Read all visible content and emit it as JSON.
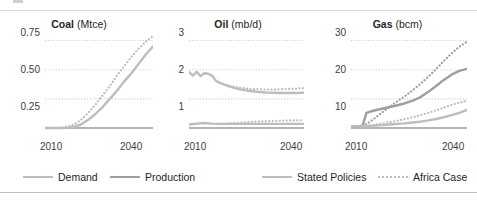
{
  "legend": {
    "items": [
      {
        "label": "Demand",
        "style": "solid",
        "color": "#bdbdbd"
      },
      {
        "label": "Production",
        "style": "solid",
        "color": "#9e9e9e"
      },
      {
        "label": "Stated Policies",
        "style": "solid",
        "color": "#bdbdbd"
      },
      {
        "label": "Africa Case",
        "style": "dotted",
        "color": "#bdbdbd"
      }
    ]
  },
  "colors": {
    "demand": "#bdbdbd",
    "production": "#9e9e9e",
    "gridline": "#c9c9c9",
    "axis": "#9b9b9b",
    "text": "#262626"
  },
  "chart_data": [
    {
      "type": "line",
      "title": "Coal (Mtce)",
      "title_bold": "Coal",
      "title_unit": "(Mtce)",
      "xlabel": "",
      "ylabel": "Mtce",
      "xlim": [
        2010,
        2040
      ],
      "ylim": [
        0,
        0.875
      ],
      "yticks": [
        0.25,
        0.5,
        0.75
      ],
      "ytick_labels": [
        "0.25",
        "0.50",
        "0.75"
      ],
      "xticks": [
        2010,
        2040
      ],
      "xtick_labels": [
        "2010",
        "2040"
      ],
      "grid": true,
      "legend_position": "below-figure",
      "series": [
        {
          "name": "Stated Policies",
          "style": "solid",
          "color": "#bdbdbd",
          "x": [
            2010,
            2012,
            2014,
            2016,
            2018,
            2020,
            2022,
            2024,
            2026,
            2028,
            2030,
            2032,
            2034,
            2036,
            2038,
            2040
          ],
          "values": [
            0.0,
            0.0,
            0.0,
            0.0,
            0.01,
            0.03,
            0.07,
            0.12,
            0.18,
            0.25,
            0.32,
            0.4,
            0.47,
            0.55,
            0.63,
            0.7
          ]
        },
        {
          "name": "Africa Case",
          "style": "dotted",
          "color": "#bdbdbd",
          "x": [
            2010,
            2012,
            2014,
            2016,
            2018,
            2020,
            2022,
            2024,
            2026,
            2028,
            2030,
            2032,
            2034,
            2036,
            2038,
            2040
          ],
          "values": [
            0.0,
            0.0,
            0.0,
            0.01,
            0.03,
            0.07,
            0.13,
            0.2,
            0.28,
            0.36,
            0.45,
            0.53,
            0.61,
            0.68,
            0.74,
            0.79
          ]
        }
      ]
    },
    {
      "type": "line",
      "title": "Oil (mb/d)",
      "title_bold": "Oil",
      "title_unit": "(mb/d)",
      "xlabel": "",
      "ylabel": "mb/d",
      "xlim": [
        2010,
        2040
      ],
      "ylim": [
        0,
        3.5
      ],
      "yticks": [
        1,
        2,
        3
      ],
      "ytick_labels": [
        "1",
        "2",
        "3"
      ],
      "xticks": [
        2010,
        2040
      ],
      "xtick_labels": [
        "2010",
        "2040"
      ],
      "grid": true,
      "legend_position": "below-figure",
      "series": [
        {
          "name": "Demand Stated Policies",
          "style": "solid",
          "color": "#bdbdbd",
          "x": [
            2010,
            2011,
            2012,
            2013,
            2014,
            2015,
            2016,
            2017,
            2018,
            2020,
            2022,
            2024,
            2026,
            2028,
            2030,
            2032,
            2034,
            2036,
            2038,
            2040
          ],
          "values": [
            1.93,
            1.8,
            1.93,
            1.78,
            1.88,
            1.86,
            1.8,
            1.62,
            1.55,
            1.45,
            1.37,
            1.31,
            1.27,
            1.24,
            1.22,
            1.21,
            1.2,
            1.2,
            1.2,
            1.21
          ]
        },
        {
          "name": "Demand Africa Case",
          "style": "dotted",
          "color": "#bdbdbd",
          "x": [
            2018,
            2020,
            2022,
            2024,
            2026,
            2028,
            2030,
            2032,
            2034,
            2036,
            2038,
            2040
          ],
          "values": [
            1.55,
            1.47,
            1.41,
            1.37,
            1.34,
            1.33,
            1.32,
            1.32,
            1.33,
            1.34,
            1.35,
            1.37
          ]
        },
        {
          "name": "Production Stated Policies",
          "style": "solid",
          "color": "#bdbdbd",
          "x": [
            2010,
            2012,
            2014,
            2016,
            2018,
            2020,
            2022,
            2024,
            2026,
            2028,
            2030,
            2032,
            2034,
            2036,
            2038,
            2040
          ],
          "values": [
            0.12,
            0.15,
            0.17,
            0.15,
            0.14,
            0.14,
            0.14,
            0.14,
            0.14,
            0.14,
            0.14,
            0.14,
            0.14,
            0.14,
            0.14,
            0.14
          ]
        },
        {
          "name": "Production Africa Case",
          "style": "dotted",
          "color": "#bdbdbd",
          "x": [
            2020,
            2022,
            2024,
            2026,
            2028,
            2030,
            2032,
            2034,
            2036,
            2038,
            2040
          ],
          "values": [
            0.15,
            0.17,
            0.19,
            0.21,
            0.22,
            0.23,
            0.24,
            0.25,
            0.26,
            0.26,
            0.27
          ]
        }
      ]
    },
    {
      "type": "line",
      "title": "Gas (bcm)",
      "title_bold": "Gas",
      "title_unit": "(bcm)",
      "xlabel": "",
      "ylabel": "bcm",
      "xlim": [
        2010,
        2040
      ],
      "ylim": [
        0,
        35
      ],
      "yticks": [
        10,
        20,
        30
      ],
      "ytick_labels": [
        "10",
        "20",
        "30"
      ],
      "xticks": [
        2010,
        2040
      ],
      "xtick_labels": [
        "2010",
        "2040"
      ],
      "grid": true,
      "legend_position": "below-figure",
      "series": [
        {
          "name": "Demand Stated Policies",
          "style": "solid",
          "color": "#9e9e9e",
          "x": [
            2010,
            2012,
            2013,
            2014,
            2015,
            2016,
            2018,
            2020,
            2022,
            2024,
            2026,
            2028,
            2030,
            2032,
            2034,
            2036,
            2038,
            2040
          ],
          "values": [
            0.6,
            0.6,
            0.8,
            5.2,
            5.6,
            6.0,
            6.6,
            7.2,
            7.8,
            8.5,
            9.4,
            10.6,
            12.4,
            14.4,
            16.5,
            18.3,
            19.6,
            20.3
          ]
        },
        {
          "name": "Demand Africa Case",
          "style": "dotted",
          "color": "#9e9e9e",
          "x": [
            2013,
            2014,
            2016,
            2018,
            2020,
            2022,
            2024,
            2026,
            2028,
            2030,
            2032,
            2034,
            2036,
            2038,
            2040
          ],
          "values": [
            0.8,
            1.4,
            3.2,
            5.3,
            7.3,
            9.2,
            11.0,
            13.0,
            15.2,
            17.6,
            20.2,
            23.0,
            25.6,
            27.9,
            29.6
          ]
        },
        {
          "name": "Production Stated Policies",
          "style": "solid",
          "color": "#bdbdbd",
          "x": [
            2010,
            2012,
            2014,
            2016,
            2018,
            2020,
            2022,
            2024,
            2026,
            2028,
            2030,
            2032,
            2034,
            2036,
            2038,
            2040
          ],
          "values": [
            0.5,
            0.6,
            0.7,
            0.8,
            1.0,
            1.2,
            1.4,
            1.6,
            1.9,
            2.2,
            2.6,
            3.1,
            3.7,
            4.4,
            5.2,
            6.2
          ]
        },
        {
          "name": "Production Africa Case",
          "style": "dotted",
          "color": "#bdbdbd",
          "x": [
            2014,
            2016,
            2018,
            2020,
            2022,
            2024,
            2026,
            2028,
            2030,
            2032,
            2034,
            2036,
            2038,
            2040
          ],
          "values": [
            0.8,
            1.1,
            1.5,
            2.0,
            2.5,
            3.1,
            3.7,
            4.4,
            5.2,
            6.1,
            7.0,
            7.9,
            8.7,
            9.4
          ]
        }
      ]
    }
  ]
}
